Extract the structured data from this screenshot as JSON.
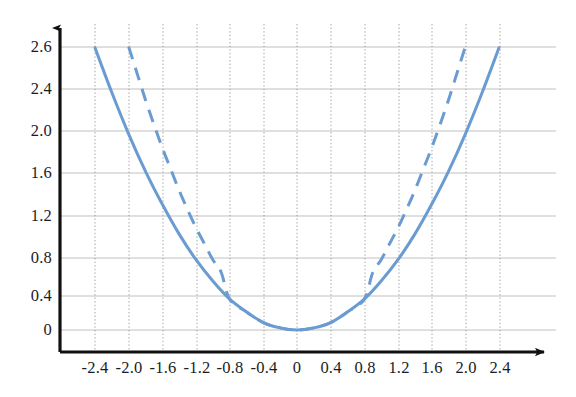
{
  "chart_data": {
    "type": "line",
    "title": "",
    "subtitle": "",
    "xlabel": "",
    "ylabel": "",
    "xlim": [
      -2.6,
      2.6
    ],
    "ylim": [
      -0.12,
      2.75
    ],
    "grid": true,
    "grid_color": "#b8b8b8",
    "legend": "none",
    "axis_style": "arrowed-axes-origin-left-bottom",
    "axis_color": "#111111",
    "accent_color": "#6a9bd1",
    "x_ticks": [
      "-2.4",
      "-2.0",
      "-1.6",
      "-1.2",
      "-0.8",
      "-0.4",
      "0",
      "0.4",
      "0.8",
      "1.2",
      "1.6",
      "2.0",
      "2.4"
    ],
    "x_tick_values": [
      -2.4,
      -2.0,
      -1.6,
      -1.2,
      -0.8,
      -0.4,
      0,
      0.4,
      0.8,
      1.2,
      1.6,
      2.0,
      2.4
    ],
    "y_ticks": [
      "0",
      "0.4",
      "0.8",
      "1.2",
      "1.6",
      "2.0",
      "2.4",
      "2.6"
    ],
    "y_tick_values": [
      0,
      0.4,
      0.8,
      1.2,
      1.6,
      2.0,
      2.4,
      2.6
    ],
    "series": [
      {
        "name": "solid-parabola",
        "style": "solid",
        "color": "#6a9bd1",
        "width": 3.0,
        "x": [
          -2.4,
          -2.2,
          -2.0,
          -1.8,
          -1.6,
          -1.4,
          -1.2,
          -1.0,
          -0.8,
          -0.6,
          -0.4,
          -0.2,
          0.0,
          0.2,
          0.4,
          0.6,
          0.8,
          1.0,
          1.2,
          1.4,
          1.6,
          1.8,
          2.0,
          2.2,
          2.4
        ],
        "values": [
          2.65,
          2.23,
          1.84,
          1.49,
          1.18,
          0.9,
          0.66,
          0.46,
          0.29,
          0.17,
          0.07,
          0.02,
          0.0,
          0.02,
          0.07,
          0.17,
          0.29,
          0.46,
          0.66,
          0.9,
          1.18,
          1.49,
          1.84,
          2.23,
          2.65
        ]
      },
      {
        "name": "dashed-parabola",
        "style": "dashed",
        "color": "#6a9bd1",
        "width": 3.0,
        "x": [
          -2.0,
          -1.9,
          -1.8,
          -1.7,
          -1.6,
          -1.5,
          -1.4,
          -1.3,
          -1.2,
          -1.1,
          -1.0,
          -0.9,
          -0.8,
          -0.6,
          -0.4,
          -0.2,
          0.0,
          0.2,
          0.4,
          0.6,
          0.8,
          0.9,
          1.0,
          1.1,
          1.2,
          1.3,
          1.4,
          1.5,
          1.6,
          1.7,
          1.8,
          1.9,
          2.0
        ],
        "values": [
          2.66,
          2.41,
          2.16,
          1.93,
          1.71,
          1.51,
          1.31,
          1.13,
          0.96,
          0.81,
          0.66,
          0.54,
          0.29,
          0.17,
          0.07,
          0.02,
          0.0,
          0.02,
          0.07,
          0.17,
          0.29,
          0.54,
          0.66,
          0.81,
          0.96,
          1.13,
          1.31,
          1.51,
          1.71,
          1.93,
          2.16,
          2.41,
          2.66
        ]
      }
    ]
  }
}
